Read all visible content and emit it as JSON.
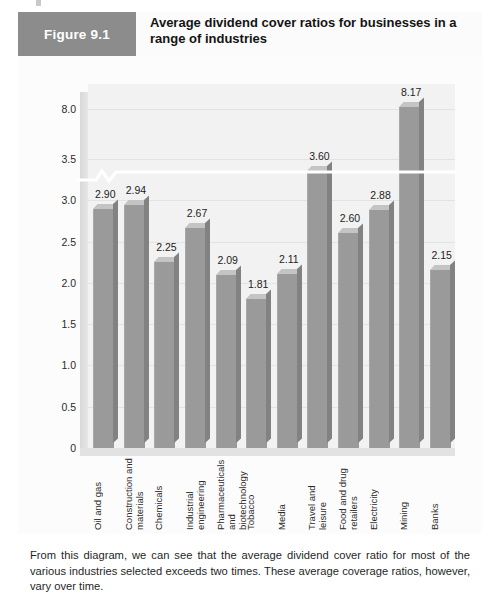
{
  "figure": {
    "number_label": "Figure 9.1",
    "title": "Average dividend cover ratios for businesses in a range of industries"
  },
  "caption": {
    "text": "From this diagram, we can see that the average dividend cover ratio for most of the various industries selected exceeds two times. These average coverage ratios, however, vary over time."
  },
  "colors": {
    "header_box": "#8c8c8c",
    "bar_front": "#9a9a9a",
    "bar_top": "#c4c4c4",
    "bar_side": "#828282",
    "plot_background": "#f2f2f2",
    "gridline": "#e3e3e3",
    "axis_break": "#ffffff"
  },
  "chart_data": {
    "type": "bar",
    "title": "Average dividend cover ratios for businesses in a range of industries",
    "xlabel": "",
    "ylabel": "",
    "categories": [
      "Oil and gas",
      "Construction and materials",
      "Chemicals",
      "Industrial engineering",
      "Pharmaceuticals and biotechnology",
      "Tobacco",
      "Media",
      "Travel and leisure",
      "Food and drug retailers",
      "Electricity",
      "Mining",
      "Banks"
    ],
    "values": [
      2.9,
      2.94,
      2.25,
      2.67,
      2.09,
      1.81,
      2.11,
      3.6,
      2.6,
      2.88,
      8.17,
      2.15
    ],
    "value_labels": [
      "2.90",
      "2.94",
      "2.25",
      "2.67",
      "2.09",
      "1.81",
      "2.11",
      "3.60",
      "2.60",
      "2.88",
      "8.17",
      "2.15"
    ],
    "ytick_labels": [
      "0",
      "0.5",
      "1.0",
      "1.5",
      "2.0",
      "2.5",
      "3.0",
      "3.5",
      "8.0"
    ],
    "ytick_values": [
      0,
      0.5,
      1.0,
      1.5,
      2.0,
      2.5,
      3.0,
      3.5,
      8.0
    ],
    "ylim": [
      0,
      8.6
    ],
    "axis_break": {
      "present": true,
      "between": [
        3.5,
        8.0
      ],
      "style": "zigzag"
    },
    "grid": true,
    "legend": false,
    "three_d": true
  }
}
